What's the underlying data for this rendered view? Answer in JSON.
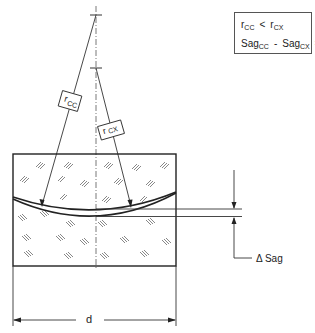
{
  "diagram": {
    "formula_box": {
      "line1": {
        "left_var": "r",
        "left_sub": "CC",
        "operator": "<",
        "right_var": "r",
        "right_sub": "CX"
      },
      "line2": {
        "term1_var": "Sag",
        "term1_sub": "CC",
        "minus": "-",
        "term2_var": "Sag",
        "term2_sub": "CX",
        "equals": "=",
        "result": "Δ Sag"
      }
    },
    "labels": {
      "r_cc": {
        "var": "r",
        "sub": "CC"
      },
      "r_cx": {
        "var": "r",
        "sub": "CX"
      },
      "delta_sag": "Δ Sag",
      "diameter": "d"
    },
    "colors": {
      "line": "#222222",
      "hatch": "#555555",
      "background": "#ffffff"
    }
  }
}
